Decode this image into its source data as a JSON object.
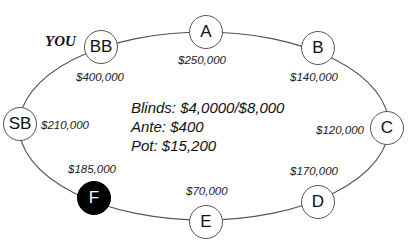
{
  "diagram": {
    "type": "poker-table",
    "you_label": "YOU",
    "seats": [
      {
        "id": "A",
        "label": "A",
        "stack": "$250,000",
        "folded": false
      },
      {
        "id": "B",
        "label": "B",
        "stack": "$140,000",
        "folded": false
      },
      {
        "id": "C",
        "label": "C",
        "stack": "$120,000",
        "folded": false
      },
      {
        "id": "D",
        "label": "D",
        "stack": "$170,000",
        "folded": false
      },
      {
        "id": "E",
        "label": "E",
        "stack": "$70,000",
        "folded": false
      },
      {
        "id": "F",
        "label": "F",
        "stack": "$185,000",
        "folded": true
      },
      {
        "id": "SB",
        "label": "SB",
        "stack": "$210,000",
        "folded": false
      },
      {
        "id": "BB",
        "label": "BB",
        "stack": "$400,000",
        "folded": false,
        "is_you": true
      }
    ],
    "info": {
      "blinds": "Blinds: $4,0000/$8,000",
      "ante": "Ante: $400",
      "pot": "Pot: $15,200"
    },
    "colors": {
      "line": "#555555",
      "folded_fill": "#000000",
      "seat_fill": "#ffffff"
    }
  }
}
